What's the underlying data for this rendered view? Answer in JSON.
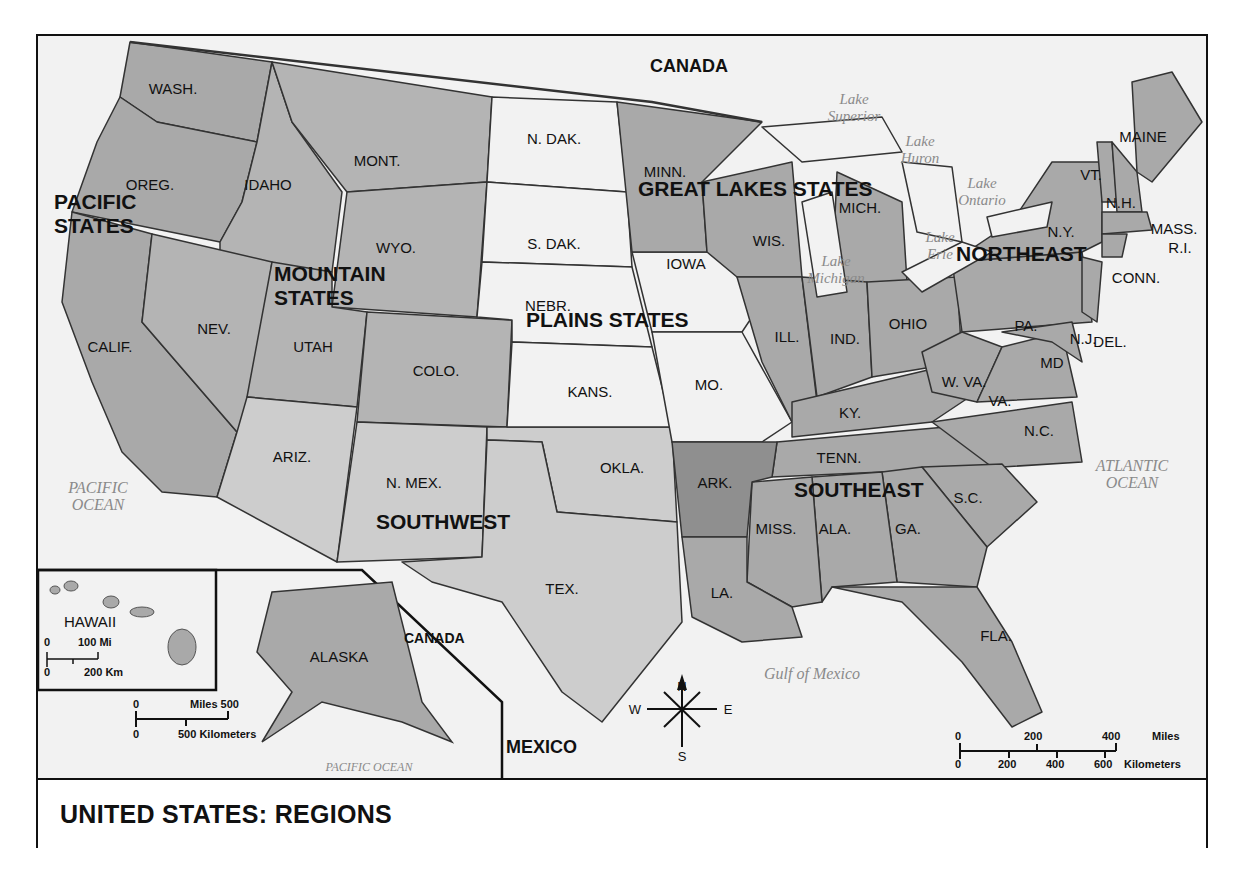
{
  "title": "UNITED STATES: REGIONS",
  "colors": {
    "region_fill": "#a9a9a9",
    "mountain_fill": "#b4b4b4",
    "plains_fill": "#f2f2f2",
    "southwest_fill": "#cdcdcd",
    "water_bg": "#f2f2f2",
    "border": "#222222",
    "water_text": "#8a8a8a"
  },
  "regions": [
    {
      "name": "PACIFIC",
      "line2": "STATES"
    },
    {
      "name": "MOUNTAIN",
      "line2": "STATES"
    },
    {
      "name": "PLAINS STATES"
    },
    {
      "name": "GREAT LAKES STATES"
    },
    {
      "name": "NORTHEAST"
    },
    {
      "name": "SOUTHEAST"
    },
    {
      "name": "SOUTHWEST"
    }
  ],
  "states": {
    "wash": "WASH.",
    "oreg": "OREG.",
    "calif": "CALIF.",
    "idaho": "IDAHO",
    "nev": "NEV.",
    "mont": "MONT.",
    "wyo": "WYO.",
    "utah": "UTAH",
    "colo": "COLO.",
    "ariz": "ARIZ.",
    "nmex": "N. MEX.",
    "ndak": "N. DAK.",
    "sdak": "S. DAK.",
    "nebr": "NEBR.",
    "kans": "KANS.",
    "iowa": "IOWA",
    "mo": "MO.",
    "minn": "MINN.",
    "wis": "WIS.",
    "mich": "MICH.",
    "ill": "ILL.",
    "ind": "IND.",
    "ohio": "OHIO",
    "okla": "OKLA.",
    "tex": "TEX.",
    "ark": "ARK.",
    "la": "LA.",
    "miss": "MISS.",
    "ala": "ALA.",
    "ga": "GA.",
    "fla": "FLA.",
    "sc": "S.C.",
    "nc": "N.C.",
    "tenn": "TENN.",
    "ky": "KY.",
    "va": "VA.",
    "wva": "W. VA.",
    "md": "MD",
    "del": "DEL.",
    "nj": "N.J.",
    "pa": "PA.",
    "ny": "N.Y.",
    "conn": "CONN.",
    "ri": "R.I.",
    "mass": "MASS.",
    "vt": "VT.",
    "nh": "N.H.",
    "maine": "MAINE",
    "alaska": "ALASKA",
    "hawaii": "HAWAII"
  },
  "countries": {
    "canada_top": "CANADA",
    "canada_inset": "CANADA",
    "mexico": "MEXICO"
  },
  "water": {
    "lake_superior": [
      "Lake",
      "Superior"
    ],
    "lake_huron": [
      "Lake",
      "Huron"
    ],
    "lake_ontario": [
      "Lake",
      "Ontario"
    ],
    "lake_erie": [
      "Lake",
      "Erie"
    ],
    "lake_michigan": [
      "Lake",
      "Michigan"
    ],
    "pacific": [
      "PACIFIC",
      "OCEAN"
    ],
    "atlantic": [
      "ATLANTIC",
      "OCEAN"
    ],
    "gulf": "Gulf of Mexico",
    "pacific_inset": "PACIFIC OCEAN"
  },
  "compass": {
    "n": "N",
    "s": "S",
    "e": "E",
    "w": "W"
  },
  "scale_main": {
    "mi0": "0",
    "mi200": "200",
    "mi400": "400",
    "mi_unit": "Miles",
    "km0": "0",
    "km200": "200",
    "km400": "400",
    "km600": "600",
    "km_unit": "Kilometers"
  },
  "scale_alaska": {
    "mi0": "0",
    "mi_label": "Miles 500",
    "km0": "0",
    "km_label": "500 Kilometers"
  },
  "scale_hawaii": {
    "mi0": "0",
    "mi_label": "100 Mi",
    "km0": "0",
    "km_label": "200 Km"
  }
}
